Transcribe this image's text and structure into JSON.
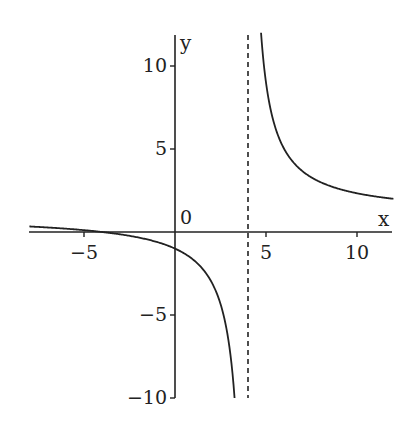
{
  "chart_data": {
    "type": "line",
    "title": "",
    "function": "g(x) = (x + 4) / (x - 4)",
    "xlabel": "x",
    "ylabel": "y",
    "xlim": [
      -8,
      12
    ],
    "ylim": [
      -10,
      12
    ],
    "grid": false,
    "legend": null,
    "origin_label": "0",
    "x_ticks": [
      -5,
      5,
      10
    ],
    "x_tick_labels": [
      "−5",
      "5",
      "10"
    ],
    "y_ticks": [
      -10,
      -5,
      5,
      10
    ],
    "y_tick_labels": [
      "−10",
      "−5",
      "5",
      "10"
    ],
    "asymptotes": {
      "vertical": {
        "x": 4,
        "style": "dashed"
      }
    },
    "series": [
      {
        "name": "left branch",
        "x": [
          -8,
          -6,
          -4,
          -2,
          0,
          1,
          2,
          3,
          3.27
        ],
        "y": [
          0.33,
          0.2,
          0,
          -0.33,
          -1,
          -1.67,
          -3,
          -7,
          -10
        ]
      },
      {
        "name": "right branch",
        "x": [
          4.73,
          5,
          6,
          7,
          8,
          10,
          12
        ],
        "y": [
          12,
          9,
          5,
          3.67,
          3,
          2.33,
          2
        ]
      }
    ]
  }
}
